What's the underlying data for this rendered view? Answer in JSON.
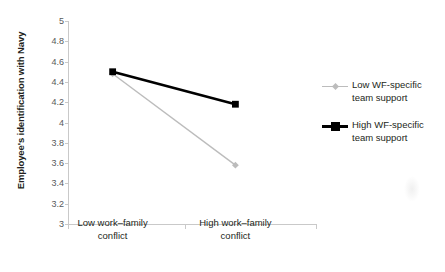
{
  "chart_data": {
    "type": "line",
    "title": "",
    "xlabel": "",
    "ylabel": "Employee's identification with Navy",
    "categories": [
      "Low work–family conflict",
      "High work–family conflict"
    ],
    "ylim": [
      3,
      5
    ],
    "ytick_step": 0.2,
    "yticks": [
      "5",
      "4.8",
      "4.6",
      "4.4",
      "4.2",
      "4",
      "3.8",
      "3.6",
      "3.4",
      "3.2",
      "3"
    ],
    "ytick_values": [
      5,
      4.8,
      4.6,
      4.4,
      4.2,
      4,
      3.8,
      3.6,
      3.4,
      3.2,
      3
    ],
    "grid": false,
    "legend_position": "right",
    "series": [
      {
        "name": "Low WF-specific team support",
        "values": [
          4.48,
          3.58
        ],
        "color": "#bcbcbc",
        "marker": "diamond",
        "line_width": 1.4
      },
      {
        "name": "High WF-specific team support",
        "values": [
          4.5,
          4.18
        ],
        "color": "#000000",
        "marker": "square",
        "line_width": 2.6
      }
    ]
  },
  "axis": {
    "y_title": "Employee's identification with Navy",
    "line_color": "#c9c9c9"
  },
  "legend": {
    "items": [
      {
        "label_line1": "Low WF-specific",
        "label_line2": "team support"
      },
      {
        "label_line1": "High WF-specific",
        "label_line2": "team support"
      }
    ]
  },
  "xcategories": [
    {
      "line1": "Low work–family",
      "line2": "conflict"
    },
    {
      "line1": "High work–family",
      "line2": "conflict"
    }
  ]
}
